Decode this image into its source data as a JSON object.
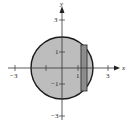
{
  "diagram": {
    "type": "region-with-slice",
    "axes": {
      "x_label": "x",
      "y_label": "y",
      "x_ticks": [
        {
          "value": -3,
          "label": "−3"
        },
        {
          "value": -1,
          "label": ""
        },
        {
          "value": 1,
          "label": "1"
        },
        {
          "value": 3,
          "label": "3"
        }
      ],
      "y_ticks": [
        {
          "value": 3,
          "label": "3"
        },
        {
          "value": 1,
          "label": "1"
        },
        {
          "value": -1,
          "label": "−1"
        },
        {
          "value": -3,
          "label": "−3"
        }
      ]
    },
    "circle": {
      "center": [
        0,
        0
      ],
      "radius": 2,
      "fill": "#bdbdbd",
      "stroke": "#1a1a1a"
    },
    "slice": {
      "x_from": 1.3,
      "x_to": 1.65,
      "fill": "#8f8f8f",
      "stroke": "#333333"
    }
  }
}
